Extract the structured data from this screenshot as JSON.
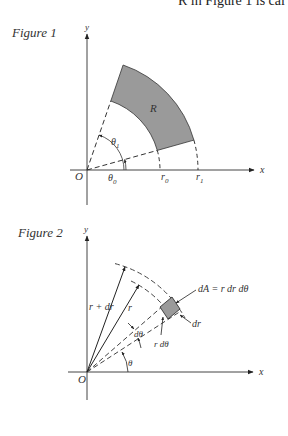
{
  "header": {
    "text": "R in Figure 1 is cal"
  },
  "figure1": {
    "label": "Figure 1",
    "axis_x": "x",
    "axis_y": "y",
    "origin": "O",
    "region": "R",
    "theta0": "θ",
    "theta0_sub": "0",
    "theta1": "θ",
    "theta1_sub": "1",
    "r0": "r",
    "r0_sub": "0",
    "r1": "r",
    "r1_sub": "1",
    "fill_color": "#9a9a9a"
  },
  "figure2": {
    "label": "Figure 2",
    "axis_x": "x",
    "axis_y": "y",
    "origin": "O",
    "r_plus_dr": "r + dr",
    "r": "r",
    "dtheta": "dθ",
    "r_dtheta": "r dθ",
    "theta": "θ",
    "dA_formula": "dA = r dr dθ",
    "dr": "dr",
    "fill_color": "#9a9a9a"
  }
}
